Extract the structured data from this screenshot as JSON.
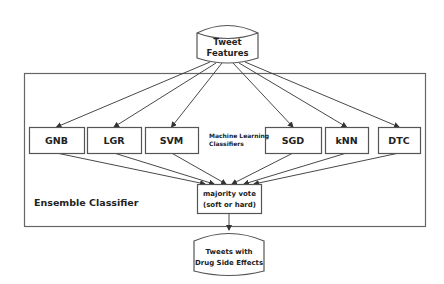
{
  "diagram": {
    "input": {
      "line1": "Tweet",
      "line2": "Features"
    },
    "ensemble_label": "Ensemble Classifier",
    "ml_label": {
      "line1": "Machine Learning",
      "line2": "Classifiers"
    },
    "classifiers": [
      {
        "id": "gnb",
        "label": "GNB"
      },
      {
        "id": "lgr",
        "label": "LGR"
      },
      {
        "id": "svm",
        "label": "SVM"
      },
      {
        "id": "sgd",
        "label": "SGD"
      },
      {
        "id": "knn",
        "label": "kNN"
      },
      {
        "id": "dtc",
        "label": "DTC"
      }
    ],
    "vote": {
      "line1": "majority vote",
      "line2": "(soft or hard)"
    },
    "output": {
      "line1": "Tweets with",
      "line2": "Drug Side Effects"
    }
  }
}
